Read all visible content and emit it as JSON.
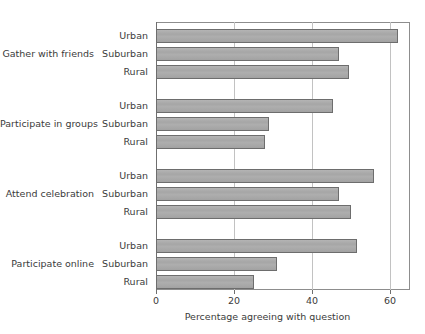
{
  "chart_data": {
    "type": "bar",
    "orientation": "horizontal",
    "title": "",
    "xlabel": "Percentage agreeing with question",
    "ylabel": "",
    "xlim": [
      0,
      65
    ],
    "xticks": [
      0,
      20,
      40,
      60
    ],
    "xtick_labels": [
      "0",
      "20",
      "40",
      "60"
    ],
    "grid": "vertical",
    "legend": "none",
    "bar_color": "#a9a9a9",
    "bar_edge_color": "#6d6d6d",
    "groups": [
      {
        "label": "Gather with friends",
        "bars": [
          {
            "category": "Urban",
            "value": 62.0
          },
          {
            "category": "Suburban",
            "value": 47.0
          },
          {
            "category": "Rural",
            "value": 49.5
          }
        ]
      },
      {
        "label": "Participate in groups",
        "bars": [
          {
            "category": "Urban",
            "value": 45.5
          },
          {
            "category": "Suburban",
            "value": 29.0
          },
          {
            "category": "Rural",
            "value": 28.0
          }
        ]
      },
      {
        "label": "Attend celebration",
        "bars": [
          {
            "category": "Urban",
            "value": 56.0
          },
          {
            "category": "Suburban",
            "value": 47.0
          },
          {
            "category": "Rural",
            "value": 50.0
          }
        ]
      },
      {
        "label": "Participate online",
        "bars": [
          {
            "category": "Urban",
            "value": 51.5
          },
          {
            "category": "Suburban",
            "value": 31.0
          },
          {
            "category": "Rural",
            "value": 25.0
          }
        ]
      }
    ]
  }
}
